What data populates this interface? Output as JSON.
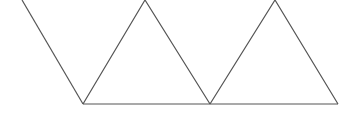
{
  "diagram": {
    "stroke_color": "#555555",
    "background_color": "#ffffff",
    "shapes": [
      {
        "type": "line",
        "name": "left-diagonal",
        "points": [
          [
            22,
            0
          ],
          [
            83,
            104
          ]
        ]
      },
      {
        "type": "polyline",
        "name": "triangle-1",
        "points": [
          [
            83,
            104
          ],
          [
            145,
            0
          ],
          [
            210,
            104
          ]
        ]
      },
      {
        "type": "polyline",
        "name": "triangle-2",
        "points": [
          [
            210,
            104
          ],
          [
            275,
            0
          ],
          [
            338,
            104
          ]
        ]
      },
      {
        "type": "line",
        "name": "baseline",
        "points": [
          [
            83,
            104
          ],
          [
            338,
            104
          ]
        ]
      }
    ]
  }
}
